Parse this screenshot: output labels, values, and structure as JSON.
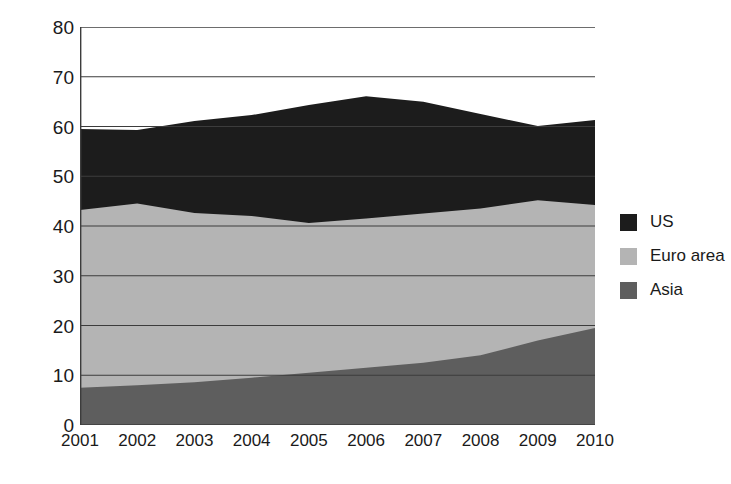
{
  "chart_data": {
    "type": "area",
    "stacked": true,
    "title": "",
    "subtitle": "",
    "xlabel": "",
    "ylabel": "% Africa Exports",
    "categories": [
      "2001",
      "2002",
      "2003",
      "2004",
      "2005",
      "2006",
      "2007",
      "2008",
      "2009",
      "2010"
    ],
    "x": [
      2001,
      2002,
      2003,
      2004,
      2005,
      2006,
      2007,
      2008,
      2009,
      2010
    ],
    "series": [
      {
        "name": "Asia",
        "color": "#5e5e5e",
        "values": [
          7.5,
          8.0,
          8.6,
          9.5,
          10.5,
          11.5,
          12.5,
          14.0,
          17.0,
          19.5
        ]
      },
      {
        "name": "Euro area",
        "color": "#b4b4b4",
        "values": [
          35.7,
          36.5,
          34.0,
          32.5,
          30.1,
          30.0,
          30.0,
          29.5,
          28.2,
          24.7
        ]
      },
      {
        "name": "US",
        "color": "#1c1c1c",
        "values": [
          16.3,
          14.8,
          18.5,
          20.3,
          23.7,
          24.6,
          22.5,
          19.0,
          14.9,
          17.1
        ]
      }
    ],
    "cumulative_tops": {
      "Asia": [
        7.5,
        8.0,
        8.6,
        9.5,
        10.5,
        11.5,
        12.5,
        14.0,
        17.0,
        19.5
      ],
      "Euro area": [
        43.2,
        44.5,
        42.6,
        42.0,
        40.6,
        41.5,
        42.5,
        43.5,
        45.2,
        44.2
      ],
      "US": [
        59.5,
        59.3,
        61.1,
        62.3,
        64.3,
        66.1,
        65.0,
        62.5,
        60.1,
        61.3
      ]
    },
    "ylim": [
      0,
      80
    ],
    "yticks": [
      0,
      10,
      20,
      30,
      40,
      50,
      60,
      70,
      80
    ],
    "ytick_labels": [
      "0",
      "10",
      "20",
      "30",
      "40",
      "50",
      "60",
      "70",
      "80"
    ],
    "grid": true,
    "grid_axis": "y",
    "grid_color": "#3c3c3c",
    "legend_position": "right",
    "legend_entries": [
      {
        "label": "US",
        "color": "#1c1c1c"
      },
      {
        "label": "Euro area",
        "color": "#b4b4b4"
      },
      {
        "label": "Asia",
        "color": "#5e5e5e"
      }
    ],
    "plot_border_color": "#3c3c3c",
    "background": "#ffffff"
  }
}
